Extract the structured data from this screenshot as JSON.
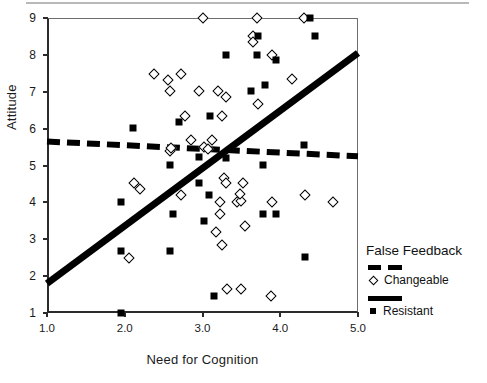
{
  "chart_data": {
    "type": "scatter",
    "title": "",
    "xlabel": "Need for Cognition",
    "ylabel": "Attitude",
    "xlim": [
      1.0,
      5.0
    ],
    "ylim": [
      1,
      9
    ],
    "xticks": [
      "1.0",
      "2.0",
      "3.0",
      "4.0",
      "5.0"
    ],
    "xtick_values": [
      1.0,
      2.0,
      3.0,
      4.0,
      5.0
    ],
    "yticks": [
      "1",
      "2",
      "3",
      "4",
      "5",
      "6",
      "7",
      "8",
      "9"
    ],
    "ytick_values": [
      1,
      2,
      3,
      4,
      5,
      6,
      7,
      8,
      9
    ],
    "grid": false,
    "legend_position": "right",
    "legend_title": "False Feedback",
    "series": [
      {
        "name": "Changeable",
        "marker": "open-diamond",
        "color": "#000000",
        "points": [
          [
            3.0,
            9.0
          ],
          [
            3.7,
            9.0
          ],
          [
            4.3,
            9.0
          ],
          [
            3.65,
            8.5
          ],
          [
            3.65,
            8.35
          ],
          [
            3.9,
            8.0
          ],
          [
            4.15,
            7.35
          ],
          [
            2.38,
            7.48
          ],
          [
            2.72,
            7.48
          ],
          [
            2.55,
            7.33
          ],
          [
            2.58,
            7.02
          ],
          [
            2.95,
            7.02
          ],
          [
            3.2,
            7.02
          ],
          [
            3.3,
            6.85
          ],
          [
            3.72,
            6.68
          ],
          [
            3.25,
            6.35
          ],
          [
            2.78,
            6.35
          ],
          [
            2.85,
            5.7
          ],
          [
            3.12,
            5.68
          ],
          [
            2.58,
            5.38
          ],
          [
            2.6,
            5.48
          ],
          [
            3.02,
            5.5
          ],
          [
            3.07,
            5.45
          ],
          [
            2.12,
            4.52
          ],
          [
            2.2,
            4.35
          ],
          [
            3.28,
            4.65
          ],
          [
            3.3,
            4.52
          ],
          [
            3.52,
            4.52
          ],
          [
            2.72,
            4.2
          ],
          [
            4.32,
            4.2
          ],
          [
            3.22,
            4.02
          ],
          [
            3.45,
            4.02
          ],
          [
            3.5,
            4.05
          ],
          [
            3.9,
            4.02
          ],
          [
            4.68,
            4.02
          ],
          [
            3.48,
            4.22
          ],
          [
            3.22,
            3.68
          ],
          [
            3.55,
            3.35
          ],
          [
            3.18,
            3.2
          ],
          [
            3.25,
            2.85
          ],
          [
            2.05,
            2.5
          ],
          [
            3.32,
            1.65
          ],
          [
            3.5,
            1.65
          ],
          [
            3.88,
            1.45
          ]
        ]
      },
      {
        "name": "Resistant",
        "marker": "filled-square",
        "color": "#000000",
        "points": [
          [
            4.38,
            9.0
          ],
          [
            4.45,
            8.5
          ],
          [
            3.72,
            8.5
          ],
          [
            3.3,
            8.0
          ],
          [
            3.7,
            8.0
          ],
          [
            3.95,
            7.85
          ],
          [
            3.8,
            7.18
          ],
          [
            3.62,
            7.02
          ],
          [
            3.1,
            6.35
          ],
          [
            2.7,
            6.18
          ],
          [
            2.1,
            6.02
          ],
          [
            4.3,
            5.55
          ],
          [
            2.95,
            5.22
          ],
          [
            3.3,
            5.2
          ],
          [
            3.78,
            5.02
          ],
          [
            2.58,
            5.02
          ],
          [
            2.95,
            4.52
          ],
          [
            3.08,
            4.2
          ],
          [
            1.95,
            4.02
          ],
          [
            2.62,
            3.68
          ],
          [
            3.78,
            3.68
          ],
          [
            3.95,
            3.68
          ],
          [
            3.02,
            3.5
          ],
          [
            1.95,
            2.68
          ],
          [
            2.58,
            2.68
          ],
          [
            4.32,
            2.52
          ],
          [
            3.15,
            1.45
          ],
          [
            1.95,
            1.0
          ]
        ]
      }
    ],
    "trend_lines": [
      {
        "name": "Changeable",
        "style": "dashed",
        "x0": 1.0,
        "y0": 5.65,
        "x1": 5.0,
        "y1": 5.25
      },
      {
        "name": "Resistant",
        "style": "solid",
        "x0": 1.0,
        "y0": 1.8,
        "x1": 5.0,
        "y1": 8.05
      }
    ]
  },
  "legend": {
    "title": "False Feedback",
    "entries": [
      {
        "label": "Changeable",
        "line_style": "dashed",
        "marker": "open-diamond"
      },
      {
        "label": "Resistant",
        "line_style": "solid",
        "marker": "filled-square"
      }
    ]
  }
}
